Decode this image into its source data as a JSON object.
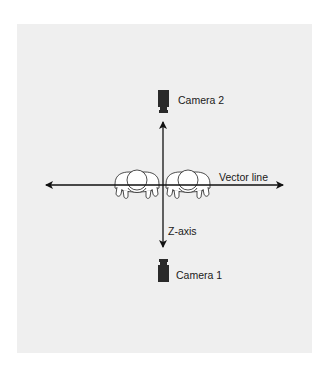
{
  "diagram": {
    "type": "camera-placement",
    "background_color": "#efefef",
    "line_color": "#111111",
    "labels": {
      "camera_top": "Camera 2",
      "camera_bottom": "Camera 1",
      "vertical_axis": "Z-axis",
      "horizontal_axis": "Vector line"
    },
    "elements": [
      {
        "name": "Camera 2",
        "position": "top",
        "facing": "down"
      },
      {
        "name": "Camera 1",
        "position": "bottom",
        "facing": "up"
      },
      {
        "name": "Person (left)",
        "view": "top-down"
      },
      {
        "name": "Person (right)",
        "view": "top-down"
      }
    ],
    "axes": [
      {
        "name": "Vector line",
        "orientation": "horizontal",
        "arrows": "both"
      },
      {
        "name": "Z-axis",
        "orientation": "vertical",
        "arrows": "both"
      }
    ]
  }
}
